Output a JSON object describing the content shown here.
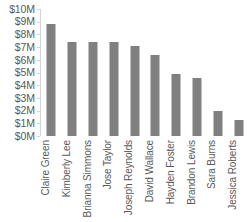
{
  "chart_data": {
    "type": "bar",
    "title": "",
    "subtitle": "",
    "xlabel": "",
    "ylabel": "",
    "grid": false,
    "legend": null,
    "orientation": "vertical",
    "bar_color": "#808080",
    "axis_color": "#d4d4d4",
    "text_color": "#595959",
    "ylim": [
      0,
      10
    ],
    "ytick_values": [
      10,
      9,
      8,
      7,
      6,
      5,
      4,
      3,
      2,
      1,
      0
    ],
    "ytick_labels": [
      "$10M",
      "$9M",
      "$8M",
      "$7M",
      "$6M",
      "$5M",
      "$4M",
      "$3M",
      "$2M",
      "$1M",
      "$0M"
    ],
    "categories": [
      "Claire Green",
      "Kimberly Lee",
      "Brianna Simmons",
      "Jose Taylor",
      "Joseph Reynolds",
      "David Wallace",
      "Hayden Foster",
      "Brandon Lewis",
      "Sara Burns",
      "Jessica Roberts"
    ],
    "values": [
      8.8,
      7.4,
      7.4,
      7.4,
      7.1,
      6.4,
      4.9,
      4.6,
      2.0,
      1.3
    ]
  }
}
